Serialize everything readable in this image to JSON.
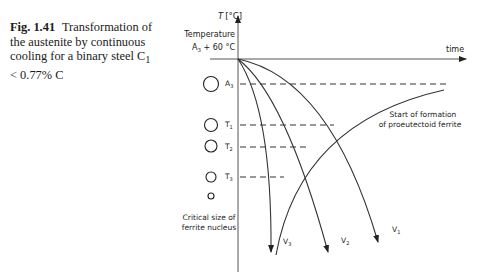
{
  "caption": {
    "figure_number": "Fig. 1.41",
    "text": "Transformation of the austenite by continuous cooling for a binary steel C",
    "subscript": "1",
    "text_end": "< 0.77% C"
  },
  "axes": {
    "y_label": "T [°C]",
    "x_label": "time",
    "start_label_line1": "Temperature",
    "start_label_line2": "A",
    "start_label_sub": "3",
    "start_label_tail": " + 60 °C"
  },
  "levels": [
    {
      "name": "A",
      "sub": "3"
    },
    {
      "name": "T",
      "sub": "1"
    },
    {
      "name": "T",
      "sub": "2"
    },
    {
      "name": "T",
      "sub": "3"
    }
  ],
  "curves": [
    {
      "name": "V",
      "sub": "1"
    },
    {
      "name": "V",
      "sub": "2"
    },
    {
      "name": "V",
      "sub": "3"
    }
  ],
  "annotations": {
    "ferrite_start_line1": "Start of formation",
    "ferrite_start_line2": "of proeutectoid ferrite",
    "nucleus_line1": "Critical size of",
    "nucleus_line2": "ferrite nucleus"
  },
  "colors": {
    "line": "#333333",
    "text": "#222222"
  }
}
